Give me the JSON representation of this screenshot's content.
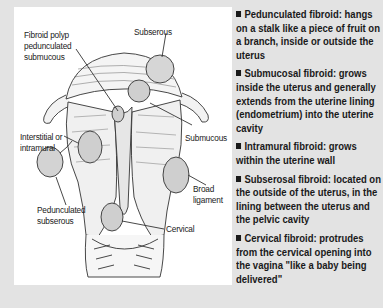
{
  "diagram": {
    "labels": {
      "fibroid_polyp": [
        "Fibroid polyp",
        "pedunculated",
        "submucous"
      ],
      "subserous": "Subserous",
      "interstitial": [
        "Interstitial or",
        "intramural"
      ],
      "submucous": "Submucous",
      "pedunculated_subserous": [
        "Pedunculated",
        "subserous"
      ],
      "broad_ligament": [
        "Broad",
        "ligament"
      ],
      "cervical": "Cervical"
    }
  },
  "sidebar": {
    "items": [
      {
        "label": "Pedunculated fibroid: hangs on a stalk like a piece of fruit on a branch, inside or outside the uterus"
      },
      {
        "label": "Submucosal fibroid: grows inside the uterus and generally extends from the uterine lining (endometrium) into the uterine cavity"
      },
      {
        "label": "Intramural fibroid: grows within the uterine wall"
      },
      {
        "label": "Subserosal fibroid: located on the outside of the uterus, in the lining between the uterus and the pelvic cavity"
      },
      {
        "label": "Cervical fibroid: protrudes from the cervical opening into the vagina \"like a baby being delivered\""
      }
    ]
  },
  "colors": {
    "background": "#e3e3e3",
    "panel": "#ffffff",
    "text": "#1a1a1a",
    "line": "#333333"
  }
}
